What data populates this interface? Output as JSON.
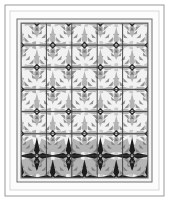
{
  "artwork": {
    "title": "Feathered Star Quilt Panel",
    "subject": "quilt",
    "orientation": "portrait",
    "canvas": {
      "width": 169,
      "height": 201,
      "background": "#ffffff"
    },
    "colors": {
      "background": "#ffffff",
      "outer_border_line": "#9a9a9a",
      "mat": "#fbfbfb",
      "inner_frame_line": "#6e6e6e",
      "binding": "#efefef",
      "stripe_light": "#efefef",
      "stripe_mid": "#c9c9c9",
      "stripe_dark": "#a8a8a8",
      "grid_line": "#3a3a3a",
      "motif_light": "#f2f2f2",
      "motif_mid": "#b4b4b4",
      "motif_dark": "#707070",
      "motif_center": "#2b2b2b",
      "bottom_row_dark": "#1d1d1d"
    },
    "frames": [
      {
        "name": "outer-border",
        "x": 5,
        "y": 5,
        "width": 159,
        "height": 191,
        "stroke": "#9a9a9a",
        "stroke_width": 1,
        "fill": "#ffffff"
      },
      {
        "name": "mat",
        "x": 10,
        "y": 11,
        "width": 149,
        "height": 179,
        "stroke": "#d8d8d8",
        "stroke_width": 1,
        "fill": "#fcfcfc"
      },
      {
        "name": "inner-frame",
        "x": 17,
        "y": 19,
        "width": 135,
        "height": 163,
        "stroke": "#6e6e6e",
        "stroke_width": 1,
        "fill": "#f4f4f4"
      }
    ],
    "field": {
      "name": "pattern-field",
      "x": 21,
      "y": 23,
      "width": 127,
      "height": 155
    },
    "grid": {
      "columns": 4,
      "rows": 7,
      "cell_width": 31.75,
      "cell_height": 22.15,
      "horizontal_rules": 7,
      "vertical_rules": 5,
      "stripe_count": 34,
      "stripe_width": 3.74
    },
    "motif": {
      "name": "feathered-star",
      "count": 27,
      "center_shape": "diamond",
      "feather_rays": 8,
      "rows_dark": [
        6
      ]
    },
    "stripe_sequence": [
      "light",
      "mid",
      "light",
      "dark",
      "light",
      "mid",
      "light",
      "dark",
      "light",
      "mid",
      "light",
      "dark",
      "light",
      "mid",
      "light",
      "dark",
      "light",
      "mid",
      "light",
      "dark",
      "light",
      "mid",
      "light",
      "dark",
      "light",
      "mid",
      "light",
      "dark",
      "light",
      "mid",
      "light",
      "dark",
      "light",
      "mid"
    ]
  }
}
